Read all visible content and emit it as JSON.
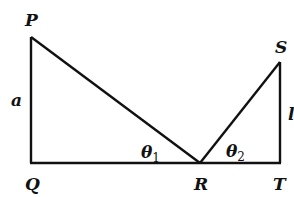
{
  "diagram": {
    "stroke_color": "#111111",
    "background": "#ffffff",
    "points": {
      "P": {
        "label": "P",
        "x": 31,
        "y": 37
      },
      "Q": {
        "label": "Q",
        "x": 31,
        "y": 163
      },
      "R": {
        "label": "R",
        "x": 200,
        "y": 163
      },
      "S": {
        "label": "S",
        "x": 280,
        "y": 62
      },
      "T": {
        "label": "T",
        "x": 280,
        "y": 163
      }
    },
    "side_labels": {
      "a": {
        "label": "a",
        "side": "PQ"
      },
      "b": {
        "label": "l",
        "side": "ST"
      }
    },
    "angle_labels": {
      "theta1": {
        "symbol": "θ",
        "subscript": "1",
        "at": "R",
        "between": "PR and RQ"
      },
      "theta2": {
        "symbol": "θ",
        "subscript": "2",
        "at": "R",
        "between": "SR and RT"
      }
    },
    "segments": [
      "PQ",
      "QT",
      "PR",
      "RS",
      "ST"
    ]
  }
}
